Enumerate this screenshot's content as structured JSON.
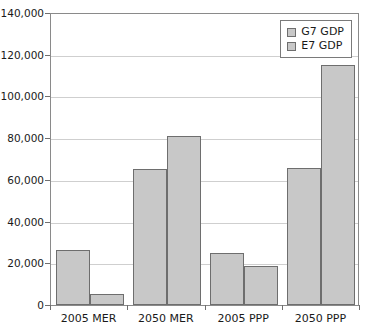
{
  "chart_data": {
    "type": "bar",
    "title": "",
    "xlabel": "",
    "ylabel": "",
    "categories": [
      "2005 MER",
      "2050 MER",
      "2005 PPP",
      "2050 PPP"
    ],
    "series": [
      {
        "name": "G7 GDP",
        "color": "#c8c8c8",
        "values": [
          26500,
          65000,
          24800,
          65500
        ]
      },
      {
        "name": "E7 GDP",
        "color": "#c8c8c8",
        "values": [
          5500,
          81000,
          18500,
          115000
        ]
      }
    ],
    "ylim": [
      0,
      140000
    ],
    "ytick_values": [
      0,
      20000,
      40000,
      60000,
      80000,
      100000,
      120000,
      140000
    ],
    "ytick_labels": [
      "0",
      "20,000",
      "40,000",
      "60,000",
      "80,000",
      "100,000",
      "120,000",
      "140,000"
    ],
    "grid": "horizontal",
    "legend_position": "top-right",
    "legend_entries": [
      "G7 GDP",
      "E7 GDP"
    ]
  },
  "style": {
    "axis_color": "#8a8a8a",
    "grid_color": "#cfcfcf",
    "bar_fill": "#c8c8c8",
    "bar_border": "#6e6e6e",
    "text_color": "#1a1a1a",
    "background": "#ffffff"
  }
}
